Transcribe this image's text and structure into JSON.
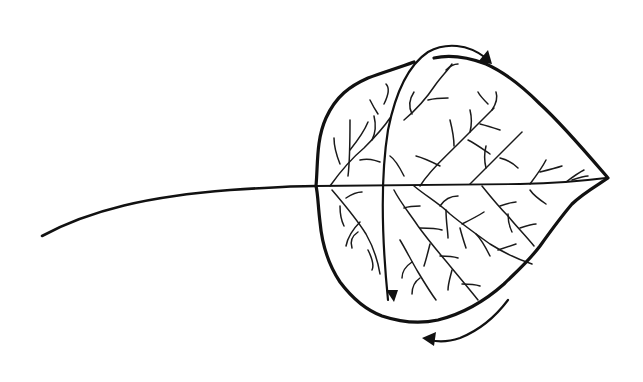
{
  "image": {
    "description": "Line drawing of a leaf (aspen-like) with a long petiole, with curved arrows indicating a flip/rotation about the leaf's vertical axis",
    "background": "#ffffff",
    "ink": "#111111"
  },
  "leaf": {
    "stem": "M 42 236 C 90 210, 150 196, 230 190 C 260 188, 290 186, 316 186",
    "outline": "M 316 186 C 318 165, 316 140, 326 118 C 336 96, 350 86, 368 78 C 384 72, 398 68, 414 62 M 434 58 C 452 54, 470 58, 486 64 C 504 72, 522 86, 540 104 C 562 124, 584 150, 608 178 C 596 186, 582 194, 572 204 C 560 218, 550 232, 540 246 C 528 262, 516 272, 504 284 C 486 300, 462 314, 438 320 C 420 324, 400 322, 382 316 C 366 310, 352 298, 340 282 C 328 264, 322 244, 320 222 C 318 206, 318 194, 316 186",
    "midrib": "M 316 186 C 380 186, 450 185, 520 184 C 560 183, 590 180, 606 178",
    "veins": [
      "M 330 186 C 340 172, 352 158, 364 148 C 372 140, 382 130, 390 118",
      "M 348 176 C 350 160, 350 140, 350 120",
      "M 350 150 C 358 140, 364 132, 368 122",
      "M 340 164 C 336 154, 334 144, 334 138",
      "M 360 160 C 368 158, 374 160, 380 162",
      "M 372 140 C 376 132, 376 124, 374 116",
      "M 384 104 C 388 96, 390 88, 386 84",
      "M 378 114 C 374 108, 372 104, 370 100",
      "M 332 190 C 344 204, 356 218, 366 234 C 374 248, 378 262, 380 274",
      "M 346 198 C 352 194, 358 192, 362 192",
      "M 340 206 C 340 214, 342 222, 344 226",
      "M 360 222 C 354 228, 348 236, 346 246",
      "M 358 232 C 352 236, 350 242, 352 248",
      "M 368 250 C 372 258, 374 266, 372 270",
      "M 420 186 C 430 170, 442 160, 456 146 C 468 134, 480 122, 494 108",
      "M 440 166 C 432 162, 424 158, 416 156",
      "M 454 146 C 454 138, 452 128, 450 120",
      "M 470 132 C 472 124, 472 118, 470 110",
      "M 480 124 C 488 126, 494 128, 500 130",
      "M 492 110 C 496 104, 498 98, 496 92",
      "M 488 104 C 484 100, 480 96, 478 92",
      "M 468 140 C 476 144, 484 150, 490 154",
      "M 404 120 C 416 110, 428 96, 436 84 C 442 76, 448 70, 452 64",
      "M 412 114 C 408 106, 410 98, 414 92",
      "M 428 100 C 436 98, 442 98, 448 98",
      "M 446 70 C 450 66, 454 64, 458 64",
      "M 404 176 C 400 168, 396 160, 390 156",
      "M 470 184 C 480 174, 488 166, 496 158 C 504 150, 512 142, 522 132",
      "M 486 168 C 484 160, 484 154, 486 146",
      "M 500 158 C 508 160, 514 164, 518 168",
      "M 530 184 C 536 176, 542 168, 546 160",
      "M 540 172 C 548 170, 556 168, 562 166",
      "M 566 182 C 574 176, 580 172, 584 170",
      "M 572 180 C 578 178, 584 176, 588 176",
      "M 414 186 C 426 196, 440 204, 450 214 C 462 224, 476 234, 490 244 C 506 254, 520 260, 532 264",
      "M 440 206 C 444 200, 450 196, 458 196",
      "M 446 210 C 446 222, 448 232, 448 238",
      "M 462 224 C 470 220, 478 216, 484 212",
      "M 460 228 C 462 236, 464 242, 466 248",
      "M 476 234 C 482 240, 486 248, 490 256",
      "M 498 250 C 504 248, 510 246, 516 244",
      "M 482 186 C 490 196, 498 206, 508 216 C 516 226, 526 236, 534 246",
      "M 500 206 C 506 204, 512 202, 516 202",
      "M 508 214 C 508 222, 510 228, 512 232",
      "M 520 228 C 526 226, 532 224, 536 224",
      "M 530 190 C 534 196, 540 200, 546 204",
      "M 394 190 C 400 202, 410 214, 418 226 C 428 240, 440 254, 450 266 C 460 278, 470 290, 478 300",
      "M 404 208 C 410 206, 416 206, 420 206",
      "M 420 228 C 428 228, 436 228, 442 230",
      "M 430 244 C 428 252, 426 260, 424 266",
      "M 440 256 C 446 256, 452 256, 458 258",
      "M 452 270 C 450 278, 448 284, 448 290",
      "M 462 284 C 468 284, 474 284, 480 286",
      "M 400 240 C 406 250, 412 262, 418 272 C 424 282, 430 292, 436 300",
      "M 412 262 C 406 266, 402 272, 402 278",
      "M 420 278 C 414 282, 412 288, 412 294"
    ]
  },
  "arrows": {
    "top": {
      "role": "curved arrow over the leaf pointing right",
      "path": "M 388 300 C 382 240, 380 180, 388 130 C 396 90, 410 64, 428 52 C 446 42, 468 44, 486 58",
      "head": "M 492 64 L 478 62 L 488 50 Z"
    },
    "bottom": {
      "role": "curved arrow beneath the leaf pointing left",
      "path": "M 508 300 C 496 316, 480 330, 460 338 C 448 342, 438 342, 430 340",
      "head": "M 422 338 L 436 332 L 434 346 Z"
    },
    "inner": {
      "role": "arrowhead ending the downward stroke inside the leaf",
      "head": "M 394 302 L 386 290 L 398 290 Z"
    }
  }
}
